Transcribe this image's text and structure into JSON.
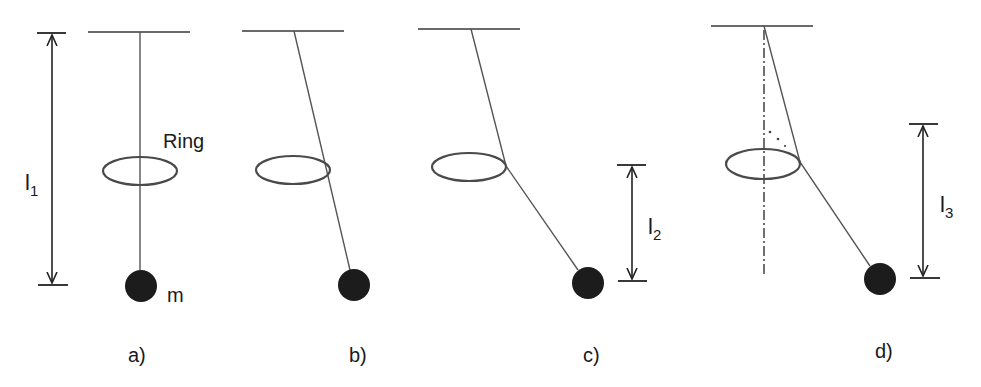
{
  "figure": {
    "type": "physics-diagram",
    "colors": {
      "background": "#ffffff",
      "ink": "#1a1a1a",
      "string": "#555555",
      "ring": "#4a4a4a",
      "mass": "#1c1c1c"
    }
  },
  "panels": [
    {
      "id": "a",
      "label": "a)",
      "ring_label": "Ring",
      "mass_label": "m",
      "dimension": {
        "symbol": "l",
        "subscript": "1"
      }
    },
    {
      "id": "b",
      "label": "b)"
    },
    {
      "id": "c",
      "label": "c)",
      "dimension": {
        "symbol": "l",
        "subscript": "2"
      }
    },
    {
      "id": "d",
      "label": "d)",
      "dimension": {
        "symbol": "l",
        "subscript": "3"
      },
      "has_vertical_reference_axis": true
    }
  ]
}
